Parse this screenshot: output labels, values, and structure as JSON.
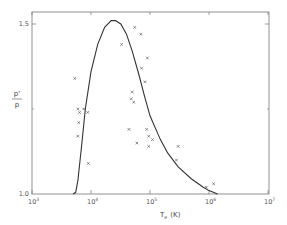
{
  "chart_data": {
    "type": "scatter",
    "title": "",
    "xlabel": "T_e (K)",
    "ylabel": "p'/p",
    "xscale": "log",
    "xlim": [
      1000,
      10000000
    ],
    "ylim": [
      1.0,
      1.5
    ],
    "x_ticks": [
      "10^3",
      "10^4",
      "10^5",
      "10^6",
      "10^7"
    ],
    "y_ticks": [
      "1.0",
      "1.5"
    ],
    "grid": false,
    "legend": null,
    "series": [
      {
        "name": "model curve",
        "kind": "line",
        "x": [
          5000,
          5500,
          6000,
          7000,
          8000,
          10000,
          13000,
          17000,
          22000,
          26000,
          32000,
          40000,
          50000,
          65000,
          80000,
          100000,
          150000,
          200000,
          300000,
          500000,
          800000,
          1000000,
          1400000
        ],
        "y": [
          1.0,
          1.005,
          1.04,
          1.15,
          1.25,
          1.36,
          1.44,
          1.49,
          1.51,
          1.51,
          1.5,
          1.47,
          1.42,
          1.35,
          1.29,
          1.23,
          1.16,
          1.12,
          1.08,
          1.045,
          1.02,
          1.01,
          1.0
        ]
      },
      {
        "name": "observations",
        "kind": "scatter",
        "marker": "x",
        "x": [
          5300,
          6000,
          6200,
          6000,
          6400,
          7500,
          9000,
          8800,
          33000,
          48000,
          50000,
          53000,
          44000,
          60000,
          55000,
          72000,
          70000,
          90000,
          82000,
          88000,
          95000,
          110000,
          95000,
          300000,
          280000,
          900000,
          1200000
        ],
        "y": [
          1.34,
          1.25,
          1.21,
          1.17,
          1.24,
          1.25,
          1.09,
          1.24,
          1.44,
          1.28,
          1.3,
          1.27,
          1.19,
          1.15,
          1.49,
          1.37,
          1.47,
          1.4,
          1.33,
          1.19,
          1.17,
          1.16,
          1.14,
          1.14,
          1.1,
          1.02,
          1.03
        ]
      }
    ]
  },
  "labels": {
    "x_axis": "T",
    "x_axis_sub": "e",
    "x_axis_unit": "(K)",
    "y_axis_num": "p'",
    "y_axis_den": "p",
    "y_tick_top": "1.5",
    "y_tick_bottom": "1.0",
    "x_tick_base": "10",
    "x_tick_exps": [
      "3",
      "4",
      "5",
      "6",
      "7"
    ]
  },
  "colors": {
    "ink": "#333333",
    "frame": "#666666",
    "background": "#ffffff"
  }
}
